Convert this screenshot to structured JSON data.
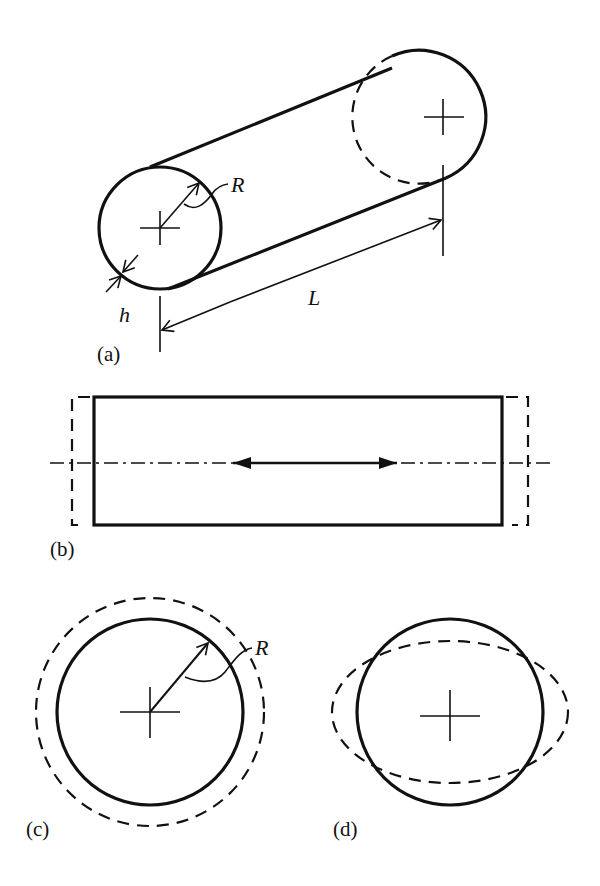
{
  "figure": {
    "panels": [
      {
        "id": "a",
        "label": "(a)",
        "description": "cylindrical shell with radius R, wall thickness h, length L"
      },
      {
        "id": "b",
        "label": "(b)",
        "description": "axial (longitudinal) deformation mode, side view"
      },
      {
        "id": "c",
        "label": "(c)",
        "description": "radial breathing mode, cross-section"
      },
      {
        "id": "d",
        "label": "(d)",
        "description": "ovalling / bending mode, cross-section"
      }
    ],
    "symbols": {
      "radius": "R",
      "thickness": "h",
      "length": "L"
    }
  }
}
